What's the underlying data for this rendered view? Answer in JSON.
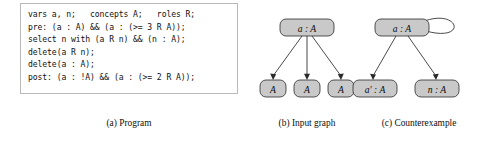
{
  "figure": {
    "program": {
      "lines": [
        "vars a, n;   concepts A;   roles R;",
        "pre: (a : A) && (a : (>= 3 R A));",
        "select n with (a R n) && (n : A);",
        "delete(a R n);",
        "delete(a : A);",
        "post: (a : !A) && (a : (>= 2 R A));"
      ],
      "full_text": "vars a, n;   concepts A;   roles R;\npre: (a : A) && (a : (>= 3 R A));\nselect n with (a R n) && (n : A);\ndelete(a R n);\ndelete(a : A);\npost: (a : !A) && (a : (>= 2 R A));"
    },
    "input_graph": {
      "root": {
        "label": "a : A"
      },
      "children": [
        {
          "label": "A"
        },
        {
          "label": "A"
        },
        {
          "label": "A"
        }
      ],
      "edge_count": 3,
      "has_self_loop": false
    },
    "counterexample": {
      "root": {
        "label": "a : A"
      },
      "children": [
        {
          "label": "a′ : A"
        },
        {
          "label": "n : A"
        }
      ],
      "edge_count": 2,
      "has_self_loop": true
    },
    "captions": {
      "a": "(a) Program",
      "b": "(b) Input graph",
      "c": "(c) Counterexample"
    },
    "colors": {
      "node_fill": "#c9c9c9",
      "node_stroke": "#2b2b2b",
      "panel_border": "#b9b9b9",
      "text": "#101010",
      "background": "#ffffff"
    }
  }
}
